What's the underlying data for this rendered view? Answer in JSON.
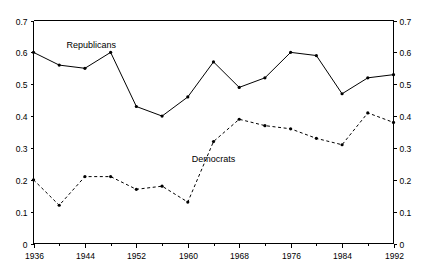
{
  "chart_data": {
    "type": "line",
    "title": "",
    "subtitle": "",
    "xlabel": "",
    "ylabel": "",
    "x": [
      1936,
      1940,
      1944,
      1948,
      1952,
      1956,
      1960,
      1964,
      1968,
      1972,
      1976,
      1980,
      1984,
      1988,
      1992
    ],
    "xlim": [
      1936,
      1992
    ],
    "ylim": [
      0.0,
      0.7
    ],
    "grid": false,
    "legend_position": "inline-annotation",
    "left_axis": {
      "ticks": [
        0.0,
        0.1,
        0.2,
        0.3,
        0.4,
        0.5,
        0.6,
        0.7
      ],
      "tick_labels": [
        "0",
        "0.1",
        "0.2",
        "0.3",
        "0.4",
        "0.5",
        "0.6",
        "0.7"
      ]
    },
    "right_axis": {
      "ticks": [
        0.0,
        0.1,
        0.2,
        0.3,
        0.4,
        0.5,
        0.6,
        0.7
      ],
      "tick_labels": [
        "0",
        "0.1",
        "0.2",
        "0.3",
        "0.4",
        "0.5",
        "0.6",
        "0.7"
      ]
    },
    "x_axis": {
      "ticks": [
        1936,
        1944,
        1952,
        1960,
        1968,
        1976,
        1984,
        1992
      ],
      "tick_labels": [
        "1936",
        "1944",
        "1952",
        "1960",
        "1968",
        "1976",
        "1984",
        "1992"
      ],
      "minor_ticks": [
        1940,
        1948,
        1956,
        1964,
        1972,
        1980,
        1988
      ]
    },
    "series": [
      {
        "name": "Republicans",
        "label": "Republicans",
        "linestyle": "solid",
        "color": "#000000",
        "marker": "dot",
        "annotation": {
          "text": "Republicans",
          "x": 1945,
          "y": 0.615
        },
        "values": [
          0.6,
          0.56,
          0.55,
          0.6,
          0.43,
          0.4,
          0.46,
          0.57,
          0.49,
          0.52,
          0.6,
          0.59,
          0.47,
          0.52,
          0.53
        ]
      },
      {
        "name": "Democrats",
        "label": "Democrats",
        "linestyle": "dashed",
        "color": "#000000",
        "marker": "dot",
        "annotation": {
          "text": "Democrats",
          "x": 1964,
          "y": 0.255
        },
        "values": [
          0.2,
          0.12,
          0.21,
          0.21,
          0.17,
          0.18,
          0.13,
          0.32,
          0.39,
          0.37,
          0.36,
          0.33,
          0.31,
          0.41,
          0.38
        ]
      }
    ]
  }
}
